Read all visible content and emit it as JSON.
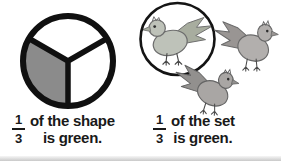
{
  "illustration": {
    "background": "#ffffff",
    "ink": "#191919",
    "description_left": "circle divided into three equal parts, one part shaded",
    "description_right": "set of three birds, one bird circled"
  },
  "left_panel": {
    "fraction": {
      "numerator": "1",
      "denominator": "3"
    },
    "caption_line1": "of the shape",
    "caption_line2": "is green.",
    "total_parts": 3,
    "shaded_parts": 1,
    "shade_color": "#8b8b8b",
    "outline_color": "#101010"
  },
  "right_panel": {
    "fraction": {
      "numerator": "1",
      "denominator": "3"
    },
    "caption_line1": "of the set",
    "caption_line2": "is green.",
    "set_total": 3,
    "green_count": 1,
    "ring_color": "#141414",
    "birds": [
      {
        "name": "green-bird-circled",
        "style": "--b-body:#bec2b9;--b-wing:#a8ad9f;--b-outline:#6d6d6d;--b-leg:#4a4a4a"
      },
      {
        "name": "gray-bird-top-right",
        "style": "--b-body:#b2afad;--b-wing:#999593;--b-outline:#696969;--b-leg:#4a4a4a"
      },
      {
        "name": "gray-bird-bottom",
        "style": "--b-body:#a9a6a4;--b-wing:#92908e;--b-outline:#646464;--b-leg:#4a4a4a"
      }
    ]
  }
}
